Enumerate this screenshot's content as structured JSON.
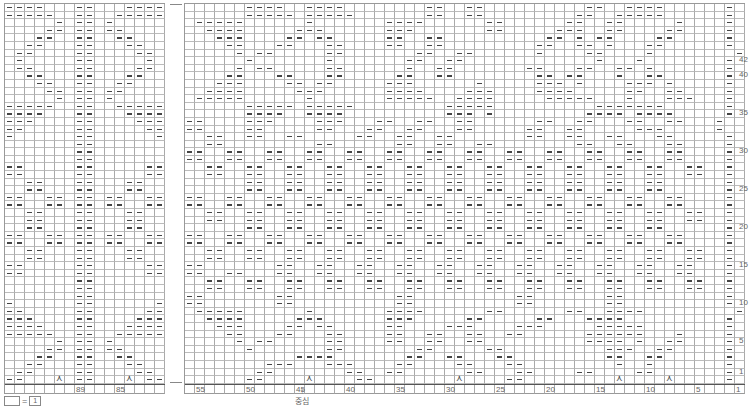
{
  "chart_title": "",
  "left_panel": {
    "columns": 16,
    "column_labels": {
      "89": 7,
      "85": 11
    },
    "rows": [
      "----...--...----",
      "-----..--..-----",
      ".....-.--.-.....",
      "....--.--.--....",
      "...--..--..--...",
      "..--...--...--..",
      ".--....--....--.",
      ".-.....--.....-.",
      ".--....--....--.",
      "..--...--...--..",
      "...--..--..--...",
      "....--.--.--....",
      ".....-.--.-.....",
      "-----..--..-----",
      "----...--...----",
      "---....--....---",
      "--.....--.....--",
      "-......--......-",
      ".......--.......",
      ".......--.......",
      ".......--.......",
      "--.....--.....--",
      "--.....--.....--",
      "..--...--...--..",
      "..--...--...--..",
      "--..--.--.--..--",
      "--..--.--.--..--",
      "..--...--...--..",
      "..--...--...--..",
      "..--...--...--..",
      "--..--.--.--..--",
      "--..--.--.--..--",
      "..--...--...--..",
      "..--...--...--..",
      "--.....--.....--",
      "--.....--.....--",
      ".......--.......",
      ".......--.......",
      ".......--.......",
      "-......--......-",
      "--.....--.....--",
      "---....--....---",
      "----...--...----",
      "-----..--..-----",
      ".....-.--.-.....",
      "....--.--.--....",
      "...--..--..--...",
      "..--...--...--..",
      ".--....--....--.",
      "--...^.--...^.--"
    ]
  },
  "right_panel": {
    "columns": 56,
    "column_labels": {
      "55": 1,
      "50": 6,
      "45": 11,
      "40": 16,
      "35": 21,
      "30": 26,
      "25": 31,
      "20": 36,
      "15": 41,
      "10": 46,
      "5": 51,
      "1": 55
    },
    "rows": [
      "......----..----........--..--..........--..----......-.",
      "......-----.-----.......--..--.........--..-----......-.",
      ".-----......-.......----......--......--..--.....-....-.",
      "..----.....---......---.......--.....---..--....--....-.",
      "...---....--.--.....--..--..........--.-.--....--.....-.",
      "....--...--...--....--..--.........--..--.-...--......-.",
      ".....-.--.....--.......--..--......-....--....-........-.",
      "......-.......-.......--..--.............-...-........-.",
      ".....-.--.....--......-..--.......--...--..--.-.......-.",
      "....--...--...--.....--..--........--.--...-..--......-.",
      "...---....--.--.....---......-.....---.-....---.-.....-.",
      "..----.....---......----....---....----.....--..--....-.",
      ".-----......-.......-----..----.....-----...-...---...-.",
      "......-----.-----.........-----..........-------......-.",
      "......----..----..........---.-.........----.----.....-.",
      "--....---....---...--..--..--......--..--...--..--...-.",
      "--....--.....--...--..--...--.....--..--.....---.....-.",
      "..--..--..--.....--..--..--.......--..--..--...--.....-.",
      "..--.........--......--..--..--........--..--...--....-.",
      "--..--..--..--..--..--..--..--..--..--..--..--..--....-.",
      "--..--..--..--..--..--..--..--..--..--..--..--..--....-.",
      "..--..--..--..--..--..--..--..--..--..--..--..--..--..-.",
      "..--..--..--..--..--..--..--..--..--..--..--..--..--..-.",
      "......--..--..--..--..--..--..--..--..--..--..--......-.",
      "......--..--..--..--..--..--..--..--..--..--..--......-.",
      "--..--..--..--..--..--..--..--..--..--..--..--..--....-.",
      "--..--..--..--..--..--..--..--..--..--..--..--..--....-.",
      "..--..--..--..--..--..--..--..--..--..--..--..--..--..-.",
      "..--..--..--..--..--..--..--..--..--..--..--..--..--..-.",
      "......--..--..--..--..--..--..--..--..--..--..--......-.",
      "--..--..--..--..--..--..--..--..--..--..--..--..--....-.",
      "--..--..--..--..--..--..--..--..--..--..--..--..--....-.",
      "..--..--..--..--..--..--..--..--..--..--..--..--..--..-.",
      "..--..--..--..--..--..--..--..--..--..--..--..--..--..-.",
      "--.......--..--..--..--..--..--..--..--..--..--..--...-.",
      "--..--...--..--..--..--..--..--..--..--..--..--..--...-.",
      "..--..--..--..--..--..--..--..--..--..--..--..--..--..-.",
      "..--..--..--..--..--..--..--..--..--..--..--..--..--..-.",
      "--.......--..........--..........--.......--..........-.",
      "--.......--..........--..........--.......--..........-.",
      ".-----......-.......----......--......--..----.........-.",
      "..----.....---......---.....--.....--...----..........-.",
      "...---....--.--.....--....---....---.....-----........-.",
      "....--...--...--....--..--..--..--......------...-....-.",
      ".....-.--.....--....--..--..--..........----.-..--....-.",
      "......-.......--.......--.....--..........---..--.....-.",
      "...........----.......--..--...--.........--..--......-.",
      "........---...---....--....--...--.........-..-.......-.",
      ".......--.......--..--......--...--....--....--.......-.",
      "......--....^....--........^....--.........^....^.....-."
    ]
  },
  "row_labels": {
    "42": 7,
    "40": 9,
    "35": 14,
    "30": 19,
    "25": 24,
    "20": 29,
    "15": 34,
    "10": 39,
    "5": 44,
    "1": 48
  },
  "center_label": "중심",
  "center_arrow": "↑",
  "legend": {
    "equals": "=",
    "value": "1"
  },
  "symbols": {
    "purl": "horizontal-dash",
    "decrease": "⋏"
  }
}
